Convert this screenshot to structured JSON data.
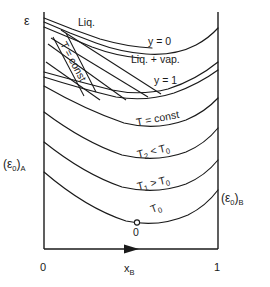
{
  "figure": {
    "kind": "phase-diagram"
  },
  "axes": {
    "y_axis_label": "ε",
    "x_axis_label_main": "x",
    "x_axis_label_sub": "B",
    "x_tick_left": "0",
    "x_tick_right": "1",
    "left_endpoint_label_main": "(ε",
    "left_endpoint_label_sub0": "0",
    "left_endpoint_label_close": ")",
    "left_endpoint_label_subA": "A",
    "right_endpoint_label_main": "(ε",
    "right_endpoint_label_sub0": "0",
    "right_endpoint_label_close": ")",
    "right_endpoint_label_subB": "B"
  },
  "region_labels": {
    "liquid": "Liq.",
    "liquid_vapour": "Liq. + vap.",
    "vapour_boundary_y0": "y = 0",
    "vapour_boundary_y1": "y = 1",
    "tieline": "T = const",
    "isotherm_const": "T = const"
  },
  "curves": [
    {
      "name": "curve-y0-dew",
      "label": "y = 0"
    },
    {
      "name": "curve-y1-bubble",
      "label": "y = 1"
    },
    {
      "name": "curve-isotherm-t-const",
      "label": "T = const"
    },
    {
      "name": "curve-isotherm-t2",
      "label": "T₂ < T₀"
    },
    {
      "name": "curve-isotherm-t1",
      "label": "T₁ > T₀"
    },
    {
      "name": "curve-isotherm-t0",
      "label": "T₀"
    }
  ],
  "isotherm_labels": {
    "t_const": "T = const",
    "t2_main": "T",
    "t2_sub": "2",
    "t2_rel": " < T",
    "t2_ref_sub": "0",
    "t1_main": "T",
    "t1_sub": "1",
    "t1_rel": " > T",
    "t1_ref_sub": "0",
    "t0_main": "T",
    "t0_sub": "0"
  },
  "markers": {
    "origin_point_label": "0"
  },
  "colors": {
    "ink": "#1a1a1a",
    "background": "#ffffff",
    "marker_fill": "#ffffff"
  }
}
